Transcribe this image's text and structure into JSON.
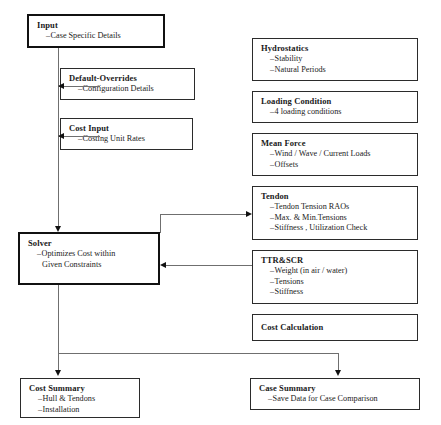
{
  "diagram": {
    "accent_color": "#111111",
    "line_color": "#6f6f6f",
    "background": "#ffffff"
  },
  "nodes": {
    "input": {
      "title": "Input",
      "items": [
        "Case Specific Details"
      ]
    },
    "default_overrides": {
      "title": "Default-Overrides",
      "items": [
        "Configuration Details"
      ]
    },
    "cost_input": {
      "title": "Cost Input",
      "items": [
        "Costing Unit Rates"
      ]
    },
    "solver": {
      "title": "Solver",
      "items": [
        "Optimizes Cost within"
      ],
      "item_continuation": "Given Constraints"
    },
    "hydrostatics": {
      "title": "Hydrostatics",
      "items": [
        "Stability",
        "Natural Periods"
      ]
    },
    "loading_condition": {
      "title": "Loading Condition",
      "items": [
        "4 loading conditions"
      ]
    },
    "mean_force": {
      "title": "Mean Force",
      "items": [
        "Wind / Wave / Current Loads",
        "Offsets"
      ]
    },
    "tendon": {
      "title": "Tendon",
      "items": [
        "Tendon Tension RAOs",
        "Max. & Min.Tensions",
        "Stiffness , Utilization Check"
      ]
    },
    "ttr_scr": {
      "title": "TTR&SCR",
      "items": [
        "Weight (in air / water)",
        "Tensions",
        "Stiffness"
      ]
    },
    "cost_calculation": {
      "title": "Cost Calculation",
      "items": []
    },
    "cost_summary": {
      "title": "Cost Summary",
      "items": [
        "Hull & Tendons",
        "Installation"
      ]
    },
    "case_summary": {
      "title": "Case Summary",
      "items": [
        "Save Data for Case Comparison"
      ]
    }
  },
  "connectors": [
    {
      "name": "input-to-default-overrides",
      "type": "arrow-left"
    },
    {
      "name": "input-to-cost-input",
      "type": "arrow-left"
    },
    {
      "name": "input-to-solver",
      "type": "arrow-down"
    },
    {
      "name": "solver-to-tendon",
      "type": "arrow-right"
    },
    {
      "name": "ttrscr-to-solver",
      "type": "arrow-left"
    },
    {
      "name": "solver-to-cost-summary",
      "type": "arrow-down"
    },
    {
      "name": "solver-to-case-summary",
      "type": "arrow-down"
    }
  ],
  "glyphs": {
    "dash": "–"
  }
}
